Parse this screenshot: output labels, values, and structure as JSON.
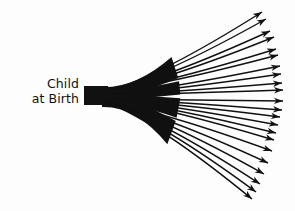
{
  "diagram": {
    "label": {
      "line1": "Child",
      "line2": "at Birth"
    },
    "colors": {
      "ink": "#111111",
      "background": "#fdfdfd"
    },
    "stem": {
      "x": 84,
      "y_top": 86,
      "y_bottom": 105,
      "length": 22
    },
    "branches": [
      {
        "group": 1,
        "from": [
          106,
          92
        ],
        "tips": [
          [
            262,
            12
          ],
          [
            266,
            19
          ],
          [
            270,
            31
          ],
          [
            274,
            37
          ],
          [
            276,
            49
          ],
          [
            278,
            55
          ]
        ]
      },
      {
        "group": 2,
        "from": [
          106,
          95
        ],
        "tips": [
          [
            280,
            66
          ],
          [
            281,
            74
          ],
          [
            282,
            83
          ],
          [
            283,
            90
          ]
        ]
      },
      {
        "group": 3,
        "from": [
          106,
          99
        ],
        "tips": [
          [
            283,
            101
          ],
          [
            282,
            110
          ],
          [
            280,
            117
          ],
          [
            278,
            125
          ],
          [
            276,
            133
          ],
          [
            274,
            140
          ]
        ]
      },
      {
        "group": 4,
        "from": [
          106,
          102
        ],
        "tips": [
          [
            272,
            151
          ],
          [
            268,
            163
          ],
          [
            264,
            174
          ],
          [
            260,
            184
          ],
          [
            256,
            192
          ],
          [
            252,
            199
          ]
        ]
      }
    ]
  }
}
